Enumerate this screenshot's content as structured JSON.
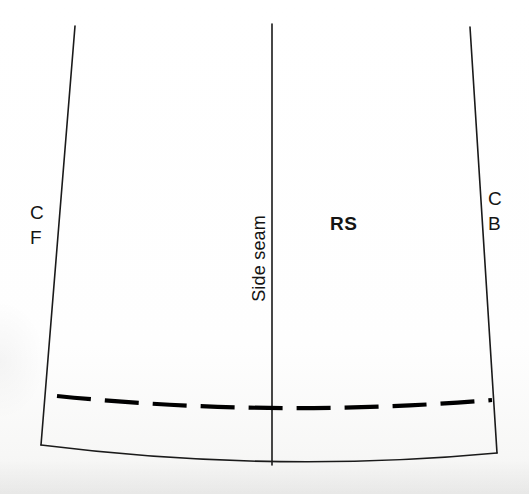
{
  "document": {
    "type": "sewing-pattern-diagram",
    "title": "Skirt panel hem marking diagram",
    "background_color": "#fdfdfc",
    "ink_color": "#1a1a1a"
  },
  "labels": {
    "center_front": {
      "line1": "C",
      "line2": "F",
      "meaning": "Centre Front",
      "position": "left of left seam line"
    },
    "center_back": {
      "line1": "C",
      "line2": "B",
      "meaning": "Centre Back",
      "position": "right of right seam line"
    },
    "right_side": {
      "text": "RS",
      "meaning": "Right Side of fabric",
      "weight": "bold"
    },
    "side_seam": {
      "text": "Side seam",
      "orientation": "rotated 90 degrees, reads bottom-to-top"
    }
  },
  "geometry": {
    "left_seam_line": {
      "name": "centre-front-edge",
      "from": [
        75,
        26
      ],
      "to": [
        41,
        445
      ],
      "style": "solid"
    },
    "right_seam_line": {
      "name": "centre-back-edge",
      "from": [
        470,
        27
      ],
      "to": [
        497,
        453
      ],
      "style": "solid"
    },
    "side_seam_line": {
      "name": "side-seam",
      "from": [
        272,
        24
      ],
      "to": [
        272,
        465
      ],
      "style": "solid"
    },
    "hem_edge": {
      "name": "raw-hem-edge",
      "from": [
        41,
        445
      ],
      "control": [
        272,
        474
      ],
      "to": [
        497,
        453
      ],
      "style": "solid curve"
    },
    "hem_fold_line": {
      "name": "hem-fold-dashed-line",
      "from": [
        57,
        396
      ],
      "control": [
        275,
        418
      ],
      "to": [
        492,
        400
      ],
      "style": "dashed",
      "dash_pattern": "34 14"
    }
  },
  "colors": {
    "ink": "#1a1a1a",
    "dash_ink": "#000000",
    "paper": "#fdfdfc"
  }
}
